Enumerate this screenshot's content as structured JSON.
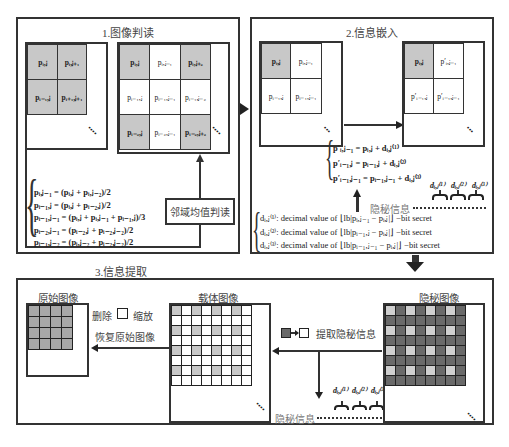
{
  "panels": {
    "p1": {
      "title": "1.图像判读"
    },
    "p2": {
      "title": "2.信息嵌入"
    },
    "p3": {
      "title": "3.信息提取"
    }
  },
  "panel1": {
    "grid_small": [
      "p_{i,j}",
      "p_{i,j+1}",
      "p_{i+1,j}",
      "p_{i+1,j+1}"
    ],
    "grid_small_text": [
      "pᵢ,ⱼ",
      "pᵢ,ⱼ₊₁",
      "pᵢ₋₁,ⱼ",
      "pᵢ₊₁,ⱼ₊₁"
    ],
    "grid_large_text": [
      "pᵢ,ⱼ",
      "pᵢ,ⱼ₋₁",
      "pᵢ,ⱼ₊₂",
      "pᵢ₋₁,ⱼ",
      "pᵢ₋₁,ⱼ₋₁",
      "pᵢ₋₁,ⱼ₋₂",
      "pᵢ₋₂,ⱼ",
      "pᵢ₋₂,ⱼ₋₁",
      "pᵢ₋₂,ⱼ₊₂"
    ],
    "equations": [
      "pᵢ,ⱼ₋₁ = (pᵢ,ⱼ + pᵢ,ⱼ₋₂)/2",
      "pᵢ₋₁,ⱼ = (pᵢ,ⱼ + pᵢ₋₂,ⱼ)/2",
      "pᵢ₋₁,ⱼ₋₁ = (pᵢ,ⱼ + pᵢ,ⱼ₋₁ + pᵢ₋₁,ⱼ)/3",
      "pᵢ₋₂,ⱼ₋₁ = (pᵢ₋₂,ⱼ + pᵢ₋₂,ⱼ₋₂)/2",
      "pᵢ₋₁,ⱼ₋₂ = (pᵢ,ⱼ₋₂ + pᵢ₋₂,ⱼ₋₂)/2"
    ],
    "mean_box": "邻域均值判读"
  },
  "panel2": {
    "grid_before": [
      "pᵢ,ⱼ",
      "pᵢ,ⱼ₋₁",
      "pᵢ₋₁,ⱼ",
      "pᵢ₋₁,ⱼ₋₁"
    ],
    "grid_after": [
      "pᵢ,ⱼ",
      "p′ᵢ,ⱼ₋₁",
      "p′ᵢ₋₁,ⱼ",
      "p′ᵢ₋₁,ⱼ₋₁"
    ],
    "embed_equations": [
      "p′ᵢ,ⱼ₋₁ = pᵢ,ⱼ + dᵢ,ⱼ⁽¹⁾",
      "p′ᵢ₋₁,ⱼ = pᵢ₋₁,ⱼ + dᵢ,ⱼ⁽²⁾",
      "p′ᵢ₋₁,ⱼ₋₁ = pᵢ₋₁,ⱼ₋₁ + dᵢ,ⱼ⁽³⁾"
    ],
    "d_labels": [
      "dᵢ,ⱼ⁽¹⁾",
      "dᵢ,ⱼ⁽²⁾",
      "dᵢ,ⱼ⁽³⁾"
    ],
    "secret_label": "隐秘信息",
    "d_definitions": [
      "dᵢ,ⱼ⁽¹⁾: decimal value of ⌊lb|pᵢ,ⱼ₋₁ − pᵢ,ⱼ|⌋ −bit secret",
      "dᵢ,ⱼ⁽²⁾: decimal value of ⌊lb|pᵢ₋₁,ⱼ − pᵢ,ⱼ|⌋ −bit secret",
      "dᵢ,ⱼ⁽³⁾: decimal value of ⌊lb|pᵢ₋₁,ⱼ₋₁ − pᵢ,ⱼ|⌋ −bit secret"
    ]
  },
  "panel3": {
    "original_label": "原始图像",
    "carrier_label": "载体图像",
    "stego_label": "隐秘图像",
    "delete_label": "删除",
    "zoom_label": "缩放",
    "restore_label": "恢复原始图像",
    "extract_label": "提取隐秘信息",
    "secret_label": "隐秘信息",
    "d_labels": [
      "dᵢ,ⱼ⁽¹⁾",
      "dᵢ,ⱼ⁽²⁾",
      "dᵢ,ⱼ⁽³⁾"
    ]
  },
  "colors": {
    "border": "#333333",
    "gray_cell": "#c8c8c8",
    "dark_cell": "#6a6a6a",
    "light_cell": "#cfcfcf",
    "original_cell": "#a8a8a8"
  }
}
